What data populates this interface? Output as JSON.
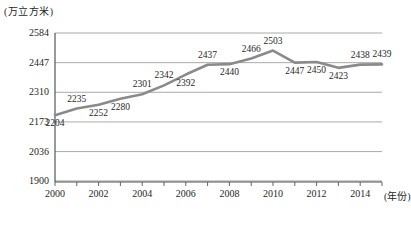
{
  "chart_data": {
    "type": "line",
    "title": "",
    "subtitle": "",
    "unit_label": "(万立方米)",
    "xlabel": "(年份)",
    "ylabel": "",
    "x": [
      2000,
      2001,
      2002,
      2003,
      2004,
      2005,
      2006,
      2007,
      2008,
      2009,
      2010,
      2011,
      2012,
      2013,
      2014,
      2015
    ],
    "values": [
      2204,
      2235,
      2252,
      2280,
      2301,
      2342,
      2392,
      2437,
      2440,
      2466,
      2503,
      2447,
      2450,
      2423,
      2438,
      2439
    ],
    "point_labels": [
      "2204",
      "2235",
      "2252",
      "2280",
      "2301",
      "2342",
      "2392",
      "2437",
      "2440",
      "2466",
      "2503",
      "2447",
      "2450",
      "2423",
      "2438",
      "2439"
    ],
    "label_positions": [
      "below",
      "above",
      "below",
      "below",
      "above",
      "above",
      "below",
      "above",
      "below",
      "above",
      "above",
      "below",
      "below",
      "below",
      "above",
      "above"
    ],
    "ylim": [
      1900,
      2584
    ],
    "yticks": [
      1900,
      2036,
      2173,
      2310,
      2447,
      2584
    ],
    "ytick_labels": [
      "1900",
      "2036",
      "2173",
      "2310",
      "2447",
      "2584"
    ],
    "xticks": [
      2000,
      2002,
      2004,
      2006,
      2008,
      2010,
      2012,
      2014
    ],
    "xtick_labels": [
      "2000",
      "2002",
      "2004",
      "2006",
      "2008",
      "2010",
      "2012",
      "2014"
    ],
    "grid": true,
    "legend": "none",
    "series_color": "#8a8a8a",
    "grid_color": "#a0a0a0",
    "axis_color": "#555555"
  }
}
